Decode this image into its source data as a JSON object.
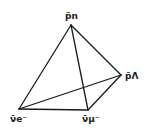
{
  "diagram": {
    "type": "tetrahedron",
    "line_color": "#1a1a1a",
    "vertices": [
      {
        "id": "top",
        "label": "p̄n",
        "x": 71,
        "y": 25
      },
      {
        "id": "right",
        "label": "p̄Λ",
        "x": 121,
        "y": 75
      },
      {
        "id": "bottom-left",
        "label": "ν̄e⁻",
        "x": 19,
        "y": 109
      },
      {
        "id": "bottom-right",
        "label": "ν̄μ⁻",
        "x": 88,
        "y": 110
      }
    ],
    "edges": [
      [
        "top",
        "bottom-left"
      ],
      [
        "top",
        "right"
      ],
      [
        "top",
        "bottom-right"
      ],
      [
        "bottom-left",
        "bottom-right"
      ],
      [
        "bottom-right",
        "right"
      ],
      [
        "bottom-left",
        "right"
      ]
    ]
  },
  "labels": {
    "top": "p̄n",
    "right": "p̄Λ",
    "bottom_left": "ν̄e⁻",
    "bottom_right": "ν̄μ⁻"
  }
}
